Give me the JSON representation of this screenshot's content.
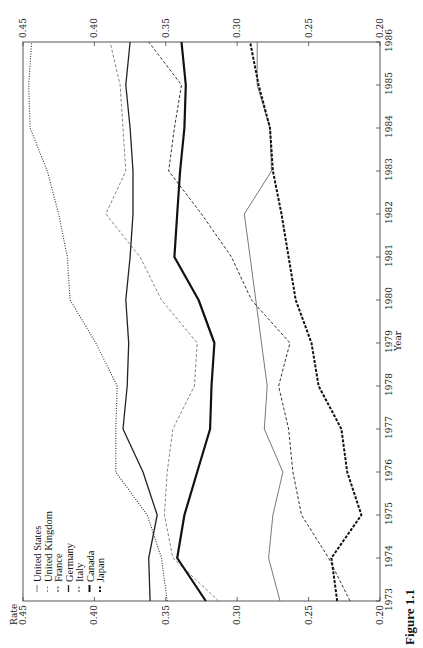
{
  "chart_data": {
    "type": "line",
    "title": "",
    "caption": "Figure 1.1",
    "xlabel": "Year",
    "ylabel": "Rate",
    "orientation_note": "Figure printed rotated 90 degrees on the page",
    "x": [
      1973,
      1974,
      1975,
      1976,
      1977,
      1978,
      1979,
      1980,
      1981,
      1982,
      1983,
      1984,
      1985,
      1986
    ],
    "xlim": [
      1973,
      1986
    ],
    "ylim": [
      0.2,
      0.45
    ],
    "yticks": [
      "0.20",
      "0.25",
      "0.30",
      "0.35",
      "0.40",
      "0.45"
    ],
    "xticks": [
      "1973",
      "1974",
      "1975",
      "1976",
      "1977",
      "1978",
      "1979",
      "1980",
      "1981",
      "1982",
      "1983",
      "1984",
      "1985",
      "1986"
    ],
    "grid": false,
    "legend_position": "upper left",
    "series": [
      {
        "name": "United States",
        "style": "thin solid",
        "color": "#555555",
        "width": 0.8,
        "dash": "",
        "values": [
          0.27,
          0.278,
          0.275,
          0.268,
          0.281,
          0.279,
          0.283,
          0.287,
          0.291,
          0.295,
          0.276,
          0.277,
          0.286,
          0.286
        ]
      },
      {
        "name": "United Kingdom",
        "style": "light dashed",
        "color": "#777777",
        "width": 0.9,
        "dash": "3,2",
        "values": [
          0.313,
          0.345,
          0.351,
          0.349,
          0.345,
          0.33,
          0.328,
          0.353,
          0.368,
          0.392,
          0.378,
          0.38,
          0.382,
          0.389
        ]
      },
      {
        "name": "France",
        "style": "dotted",
        "color": "#333333",
        "width": 1.1,
        "dash": "1,1.5",
        "values": [
          0.349,
          0.353,
          0.363,
          0.385,
          0.385,
          0.384,
          0.399,
          0.417,
          0.419,
          0.425,
          0.433,
          0.445,
          0.446,
          0.444
        ]
      },
      {
        "name": "Germany",
        "style": "medium solid",
        "color": "#222222",
        "width": 1.3,
        "dash": "",
        "values": [
          0.361,
          0.362,
          0.356,
          0.366,
          0.38,
          0.377,
          0.376,
          0.378,
          0.375,
          0.373,
          0.373,
          0.375,
          0.378,
          0.375
        ]
      },
      {
        "name": "Italy",
        "style": "dashed",
        "color": "#333333",
        "width": 1.0,
        "dash": "3,2",
        "values": [
          0.221,
          0.236,
          0.255,
          0.261,
          0.264,
          0.271,
          0.263,
          0.29,
          0.304,
          0.325,
          0.348,
          0.344,
          0.339,
          0.362
        ]
      },
      {
        "name": "Canada",
        "style": "thick solid",
        "color": "#111111",
        "width": 2.2,
        "dash": "",
        "values": [
          0.322,
          0.342,
          0.337,
          0.328,
          0.319,
          0.318,
          0.316,
          0.327,
          0.344,
          0.342,
          0.34,
          0.337,
          0.336,
          0.339
        ]
      },
      {
        "name": "Japan",
        "style": "thick dashed",
        "color": "#111111",
        "width": 2.0,
        "dash": "3,1.5",
        "values": [
          0.23,
          0.234,
          0.213,
          0.223,
          0.227,
          0.243,
          0.248,
          0.259,
          0.264,
          0.269,
          0.275,
          0.277,
          0.285,
          0.291
        ]
      }
    ]
  },
  "legend": {
    "items": [
      {
        "marker": "—",
        "label": "United States"
      },
      {
        "marker": "- -",
        "label": "United Kingdom"
      },
      {
        "marker": "....",
        "label": "France"
      },
      {
        "marker": "—",
        "label": "Germany"
      },
      {
        "marker": "- -",
        "label": "Italy"
      },
      {
        "marker": "—",
        "label": "Canada"
      },
      {
        "marker": "--",
        "label": "Japan"
      }
    ]
  },
  "axes": {
    "rate_title": "Rate",
    "year_title": "Year"
  },
  "layout": {
    "plot_left": 23,
    "plot_right": 380,
    "plot_top": 42,
    "plot_bottom": 601
  }
}
